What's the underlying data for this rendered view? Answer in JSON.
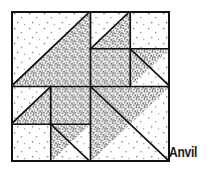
{
  "figure": {
    "name": "Anvil",
    "label": "Anvil",
    "kind": "quilt-block-diagram",
    "grid": {
      "rows": 4,
      "cols": 4
    },
    "colors": {
      "background": "#ffffff",
      "light_fill": "#ffffff",
      "dark_fill": "#9a9a9a",
      "outline": "#111111",
      "label_color": "#1a1a1a"
    },
    "patches": [
      {
        "id": "patch-top-left-large",
        "row": 0,
        "col": 0,
        "span": 2,
        "shape": "half-square-triangle",
        "dark_corner": "bottom-right"
      },
      {
        "id": "patch-r0c2",
        "row": 0,
        "col": 2,
        "span": 1,
        "shape": "half-square-triangle",
        "dark_corner": "bottom-right"
      },
      {
        "id": "patch-r0c3",
        "row": 0,
        "col": 3,
        "span": 1,
        "shape": "plain",
        "fill": "light"
      },
      {
        "id": "patch-r1c2",
        "row": 1,
        "col": 2,
        "span": 1,
        "shape": "plain",
        "fill": "dark"
      },
      {
        "id": "patch-r1c3",
        "row": 1,
        "col": 3,
        "span": 1,
        "shape": "half-square-triangle",
        "dark_corner": "top-left"
      },
      {
        "id": "patch-r2c0",
        "row": 2,
        "col": 0,
        "span": 1,
        "shape": "half-square-triangle",
        "dark_corner": "bottom-right"
      },
      {
        "id": "patch-r2c1",
        "row": 2,
        "col": 1,
        "span": 1,
        "shape": "plain",
        "fill": "dark"
      },
      {
        "id": "patch-r3c0",
        "row": 3,
        "col": 0,
        "span": 1,
        "shape": "plain",
        "fill": "light"
      },
      {
        "id": "patch-r3c1",
        "row": 3,
        "col": 1,
        "span": 1,
        "shape": "half-square-triangle",
        "dark_corner": "top-left"
      },
      {
        "id": "patch-bottom-right-large",
        "row": 2,
        "col": 2,
        "span": 2,
        "shape": "half-square-triangle",
        "dark_corner": "top-left"
      }
    ]
  }
}
